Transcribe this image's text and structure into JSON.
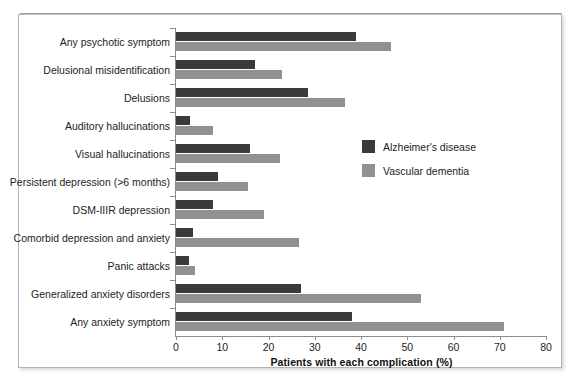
{
  "chart_data": {
    "type": "bar",
    "orientation": "horizontal",
    "title": "",
    "xlabel": "Patients with each complication (%)",
    "ylabel": "",
    "xlim": [
      0,
      80
    ],
    "xticks": [
      0,
      10,
      20,
      30,
      40,
      50,
      60,
      70,
      80
    ],
    "grid": false,
    "legend_position": "center-right",
    "categories": [
      "Any psychotic symptom",
      "Delusional misidentification",
      "Delusions",
      "Auditory hallucinations",
      "Visual hallucinations",
      "Persistent depression (>6 months)",
      "DSM-IIIR depression",
      "Comorbid depression and anxiety",
      "Panic attacks",
      "Generalized anxiety disorders",
      "Any anxiety symptom"
    ],
    "series": [
      {
        "name": "Alzheimer's disease",
        "color": "#3a3a3a",
        "values": [
          39,
          17,
          28.5,
          3,
          16,
          9,
          8,
          3.7,
          2.8,
          27,
          38
        ]
      },
      {
        "name": "Vascular dementia",
        "color": "#919191",
        "values": [
          46.5,
          23,
          36.5,
          8,
          22.5,
          15.5,
          19,
          26.5,
          4,
          53,
          71
        ]
      }
    ]
  },
  "legend": {
    "items": [
      {
        "label": "Alzheimer's disease",
        "color": "#3a3a3a"
      },
      {
        "label": "Vascular dementia",
        "color": "#919191"
      }
    ]
  },
  "axis": {
    "x_title": "Patients with each complication (%)",
    "x_tick_labels": [
      "0",
      "10",
      "20",
      "30",
      "40",
      "50",
      "60",
      "70",
      "80"
    ]
  }
}
